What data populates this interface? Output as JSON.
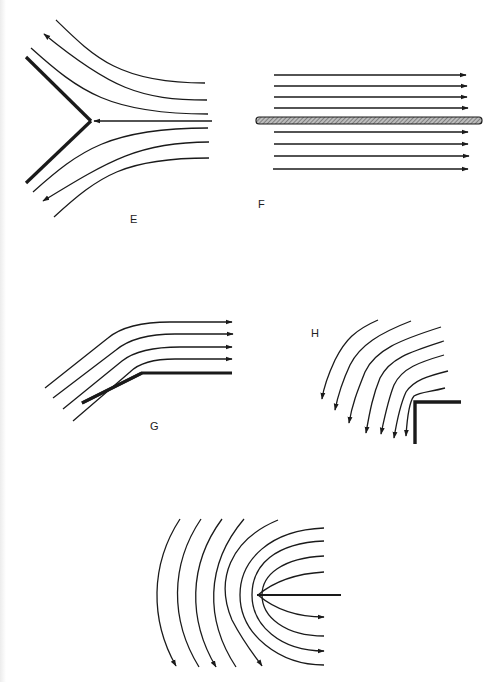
{
  "figure": {
    "colors": {
      "line": "#1a1a1a",
      "wall": "#111111",
      "plate_fill": "#9a9a9a",
      "background": "#ffffff"
    }
  },
  "panels": {
    "E": {
      "label": "E",
      "caption": "Flow approaching a V-shaped wedge, splitting above and below",
      "streamlines": 7,
      "arrows": 3
    },
    "F": {
      "label": "F",
      "caption": "Uniform parallel flow along a thin hatched flat plate",
      "streamlines_above": 4,
      "streamlines_below": 4
    },
    "G": {
      "label": "G",
      "caption": "Flow turning around a convex corner (inclined wall to horizontal wall)",
      "streamlines": 4
    },
    "H": {
      "label": "H",
      "caption": "Flow turning downward around an L-shaped corner",
      "streamlines": 7
    },
    "I": {
      "label": "",
      "caption": "Flow around the leading edge of a semi-infinite plate",
      "streamlines_left": 4,
      "streamlines_right": 8
    }
  }
}
